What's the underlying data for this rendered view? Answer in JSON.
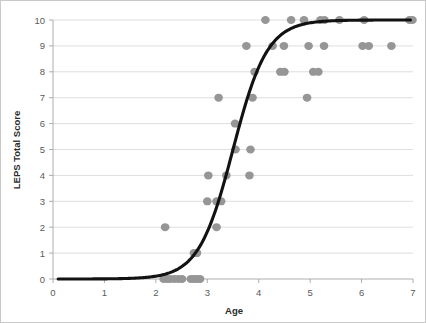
{
  "chart_data": {
    "type": "scatter",
    "title": "",
    "xlabel": "Age",
    "ylabel": "LEPS Total Score",
    "xlim": [
      0,
      7
    ],
    "ylim": [
      0,
      10
    ],
    "xticks": [
      0,
      1,
      2,
      3,
      4,
      5,
      6,
      7
    ],
    "yticks": [
      0,
      1,
      2,
      3,
      4,
      5,
      6,
      7,
      8,
      9,
      10
    ],
    "xtick_labels": [
      "0",
      "1",
      "2",
      "3",
      "4",
      "5",
      "6",
      "7"
    ],
    "ytick_labels": [
      "0",
      "1",
      "2",
      "3",
      "4",
      "5",
      "6",
      "7",
      "8",
      "9",
      "10"
    ],
    "grid": "horizontal",
    "legend": "none",
    "marker_color": "#969696",
    "curve_color": "#121212",
    "points": [
      {
        "x": 2.15,
        "y": 0
      },
      {
        "x": 2.22,
        "y": 0
      },
      {
        "x": 2.28,
        "y": 0
      },
      {
        "x": 2.36,
        "y": 0
      },
      {
        "x": 2.44,
        "y": 0
      },
      {
        "x": 2.51,
        "y": 0
      },
      {
        "x": 2.68,
        "y": 0
      },
      {
        "x": 2.74,
        "y": 0
      },
      {
        "x": 2.8,
        "y": 0
      },
      {
        "x": 2.86,
        "y": 0
      },
      {
        "x": 2.74,
        "y": 1
      },
      {
        "x": 2.8,
        "y": 1
      },
      {
        "x": 2.18,
        "y": 2
      },
      {
        "x": 3.18,
        "y": 2
      },
      {
        "x": 3.0,
        "y": 3
      },
      {
        "x": 3.18,
        "y": 3
      },
      {
        "x": 3.27,
        "y": 3
      },
      {
        "x": 3.02,
        "y": 4
      },
      {
        "x": 3.37,
        "y": 4
      },
      {
        "x": 3.82,
        "y": 4
      },
      {
        "x": 3.55,
        "y": 5
      },
      {
        "x": 3.84,
        "y": 5
      },
      {
        "x": 3.54,
        "y": 6
      },
      {
        "x": 3.22,
        "y": 7
      },
      {
        "x": 3.88,
        "y": 7
      },
      {
        "x": 4.94,
        "y": 7
      },
      {
        "x": 3.92,
        "y": 8
      },
      {
        "x": 4.42,
        "y": 8
      },
      {
        "x": 4.5,
        "y": 8
      },
      {
        "x": 5.06,
        "y": 8
      },
      {
        "x": 5.16,
        "y": 8
      },
      {
        "x": 3.76,
        "y": 9
      },
      {
        "x": 4.27,
        "y": 9
      },
      {
        "x": 4.49,
        "y": 9
      },
      {
        "x": 4.97,
        "y": 9
      },
      {
        "x": 5.27,
        "y": 9
      },
      {
        "x": 6.02,
        "y": 9
      },
      {
        "x": 6.14,
        "y": 9
      },
      {
        "x": 6.58,
        "y": 9
      },
      {
        "x": 4.13,
        "y": 10
      },
      {
        "x": 4.63,
        "y": 10
      },
      {
        "x": 4.88,
        "y": 10
      },
      {
        "x": 5.2,
        "y": 10
      },
      {
        "x": 5.28,
        "y": 10
      },
      {
        "x": 5.57,
        "y": 10
      },
      {
        "x": 6.05,
        "y": 10
      },
      {
        "x": 6.93,
        "y": 10
      },
      {
        "x": 6.99,
        "y": 10
      }
    ],
    "curve": {
      "description": "logistic fit",
      "midpoint_x": 3.5,
      "steepness": 3.0,
      "lower_asymptote": 0,
      "upper_asymptote": 10,
      "x_start": 0.1,
      "x_end": 6.95
    }
  }
}
